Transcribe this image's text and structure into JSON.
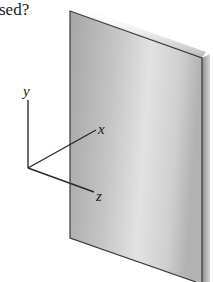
{
  "text": {
    "partial_question": "sed?"
  },
  "figure": {
    "axes": {
      "y_label": "y",
      "x_label": "x",
      "z_label": "z"
    },
    "colors": {
      "plate_dark": "#a4a4a4",
      "plate_light": "#e4e4e4",
      "edge": "#3a3a3a",
      "axis": "#2a2a2a"
    }
  }
}
